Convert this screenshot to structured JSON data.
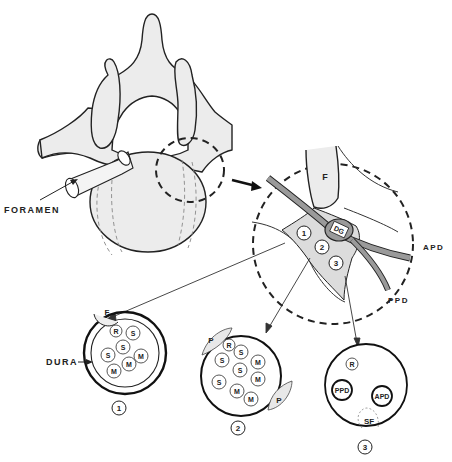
{
  "diagram": {
    "type": "anatomical-illustration",
    "labels": {
      "foramen": "FORAMEN",
      "dura": "DURA",
      "apd": "APD",
      "ppd": "PPD",
      "facet": "F",
      "dg": "DG"
    },
    "zones": [
      {
        "id": "1",
        "label": "1"
      },
      {
        "id": "2",
        "label": "2"
      },
      {
        "id": "3",
        "label": "3"
      }
    ],
    "sections": [
      {
        "id": "1",
        "label": "1",
        "boundary_labels": [
          "F"
        ],
        "fascicles": [
          "R",
          "S",
          "S",
          "S",
          "M",
          "M",
          "M"
        ]
      },
      {
        "id": "2",
        "label": "2",
        "boundary_labels": [
          "P",
          "P"
        ],
        "fascicles": [
          "R",
          "S",
          "S",
          "S",
          "S",
          "M",
          "M",
          "M",
          "M"
        ]
      },
      {
        "id": "3",
        "label": "3",
        "boundary_labels": [
          "SF"
        ],
        "fascicles": [
          "R",
          "PPD",
          "APD"
        ]
      }
    ],
    "colors": {
      "bone": "#ececec",
      "outline": "#222222",
      "nerve": "#9a9a9a",
      "stipple": "#d8d8d8"
    }
  }
}
